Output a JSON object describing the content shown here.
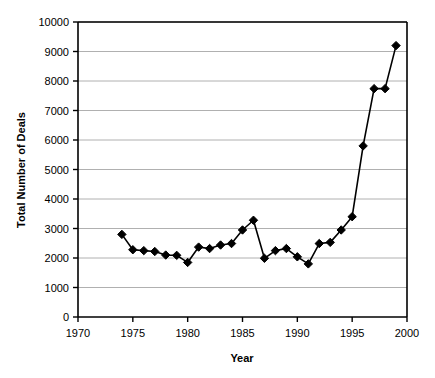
{
  "chart_data": {
    "type": "line",
    "title": "",
    "xlabel": "Year",
    "ylabel": "Total Number of Deals",
    "xlim": [
      1970,
      2000
    ],
    "ylim": [
      0,
      10000
    ],
    "xticks": [
      1970,
      1975,
      1980,
      1985,
      1990,
      1995,
      2000
    ],
    "yticks": [
      0,
      1000,
      2000,
      3000,
      4000,
      5000,
      6000,
      7000,
      8000,
      9000,
      10000
    ],
    "grid": "horizontal",
    "legend": "none",
    "marker": "diamond",
    "marker_color": "#000000",
    "line_color": "#000000",
    "x": [
      1974,
      1975,
      1976,
      1977,
      1978,
      1979,
      1980,
      1981,
      1982,
      1983,
      1984,
      1985,
      1986,
      1987,
      1988,
      1989,
      1990,
      1991,
      1992,
      1993,
      1994,
      1995,
      1996,
      1997,
      1998,
      1999
    ],
    "values": [
      2800,
      2280,
      2250,
      2220,
      2100,
      2090,
      1850,
      2370,
      2320,
      2440,
      2490,
      2950,
      3280,
      1990,
      2250,
      2320,
      2040,
      1800,
      2490,
      2530,
      2950,
      3400,
      5800,
      7740,
      7740,
      9200
    ],
    "series": [
      {
        "name": "Total Number of Deals",
        "values": [
          2800,
          2280,
          2250,
          2220,
          2100,
          2090,
          1850,
          2370,
          2320,
          2440,
          2490,
          2950,
          3280,
          1990,
          2250,
          2320,
          2040,
          1800,
          2490,
          2530,
          2950,
          3400,
          5800,
          7740,
          7740,
          9200
        ]
      }
    ]
  },
  "axis": {
    "x_label": "Year",
    "y_label": "Total Number of Deals",
    "x_tick_labels": [
      "1970",
      "1975",
      "1980",
      "1985",
      "1990",
      "1995",
      "2000"
    ],
    "y_tick_labels": [
      "0",
      "1000",
      "2000",
      "3000",
      "4000",
      "5000",
      "6000",
      "7000",
      "8000",
      "9000",
      "10000"
    ]
  },
  "colors": {
    "background": "#ffffff",
    "axis": "#000000",
    "grid": "#b0b0b0",
    "series": "#000000"
  }
}
